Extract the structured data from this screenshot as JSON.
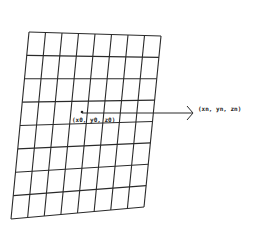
{
  "diagram": {
    "grid": {
      "columns": 8,
      "rows": 8
    },
    "origin_label": "(x0, y0, z0)",
    "target_label": "(xn, yn, zn)",
    "colors": {
      "line": "#2a2a2a",
      "background": "#ffffff"
    }
  }
}
